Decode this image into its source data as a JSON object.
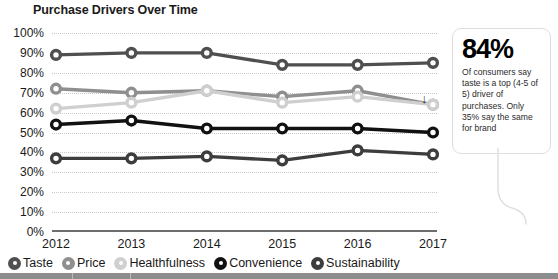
{
  "title": "Purchase Drivers Over Time",
  "axis": {
    "y_ticks": [
      "0%",
      "10%",
      "20%",
      "30%",
      "40%",
      "50%",
      "60%",
      "70%",
      "80%",
      "90%",
      "100%"
    ],
    "x_ticks": [
      "2012",
      "2013",
      "2014",
      "2015",
      "2016",
      "2017"
    ]
  },
  "annotation": {
    "arrow_glyph": "↓"
  },
  "legend": {
    "items": [
      {
        "label": "Taste",
        "color": "#4f4f4f"
      },
      {
        "label": "Price",
        "color": "#8f8f8f"
      },
      {
        "label": "Healthfulness",
        "color": "#cfcfcf"
      },
      {
        "label": "Convenience",
        "color": "#111111"
      },
      {
        "label": "Sustainability",
        "color": "#3d3d3d"
      }
    ]
  },
  "callout": {
    "stat": "84%",
    "body": "Of consumers say taste is a top (4-5 of 5) driver of purchases. Only 35% say the same for brand"
  },
  "chart_data": {
    "type": "line",
    "title": "Purchase Drivers Over Time",
    "xlabel": "",
    "ylabel": "",
    "x": [
      "2012",
      "2013",
      "2014",
      "2015",
      "2016",
      "2017"
    ],
    "ylim": [
      0,
      100
    ],
    "ytick_step": 10,
    "grid": true,
    "legend_position": "bottom",
    "series": [
      {
        "name": "Taste",
        "color": "#4f4f4f",
        "values": [
          89,
          90,
          90,
          84,
          84,
          85
        ]
      },
      {
        "name": "Price",
        "color": "#8f8f8f",
        "values": [
          72,
          70,
          71,
          68,
          71,
          64
        ]
      },
      {
        "name": "Healthfulness",
        "color": "#cfcfcf",
        "values": [
          62,
          65,
          71,
          65,
          68,
          64
        ]
      },
      {
        "name": "Convenience",
        "color": "#111111",
        "values": [
          54,
          56,
          52,
          52,
          52,
          50
        ]
      },
      {
        "name": "Sustainability",
        "color": "#3d3d3d",
        "values": [
          37,
          37,
          38,
          36,
          41,
          39
        ]
      }
    ]
  }
}
